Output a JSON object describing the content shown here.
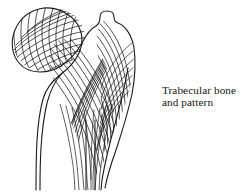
{
  "figure": {
    "name": "proximal-femur-trabecular-diagram",
    "subject": "Trabecular bone",
    "style": "line-art",
    "background_color": "#ffffff",
    "stroke_color": "#1a1a1a"
  },
  "label": {
    "line1": "Trabecular bone",
    "line2": "and pattern"
  },
  "anatomy": {
    "parts": [
      "femoral-head",
      "femoral-neck",
      "greater-trochanter",
      "femoral-shaft",
      "medullary-cavity",
      "calcar-femorale"
    ]
  },
  "trabecular_systems": {
    "compressive_group": "principal compressive trabeculae",
    "tensile_group": "principal tensile trabeculae",
    "crosshatch": true
  }
}
